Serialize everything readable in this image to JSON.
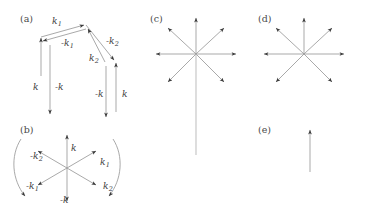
{
  "figure": {
    "width": 371,
    "height": 210,
    "background": "#ffffff",
    "stroke_color": "#9a9a9a",
    "arrowhead_color": "#3a3a3a",
    "label_color": "#3b3b3b",
    "panel_label_color": "#4a4a4a"
  },
  "panels": [
    {
      "id": "a",
      "label": "(a)",
      "label_pos": [
        20,
        13
      ],
      "description": "paired chevron of antiparallel wavevector arrows",
      "labels": [
        {
          "text": "k",
          "sub": "1",
          "x": 52,
          "y": 16,
          "name": "label-k1-outer"
        },
        {
          "text": "-k",
          "sub": "1",
          "x": 61,
          "y": 38,
          "name": "label-minus-k1-inner"
        },
        {
          "text": "k",
          "sub": "2",
          "x": 89,
          "y": 53,
          "name": "label-k2-inner"
        },
        {
          "text": "-k",
          "sub": "2",
          "x": 106,
          "y": 36,
          "name": "label-minus-k2-outer"
        },
        {
          "text": "k",
          "sub": "",
          "x": 33,
          "y": 82,
          "name": "label-k-left-outer"
        },
        {
          "text": "-k",
          "sub": "",
          "x": 55,
          "y": 82,
          "name": "label-minus-k-left-inner"
        },
        {
          "text": "-k",
          "sub": "",
          "x": 95,
          "y": 89,
          "name": "label-minus-k-right-inner"
        },
        {
          "text": "k",
          "sub": "",
          "x": 122,
          "y": 89,
          "name": "label-k-right-outer"
        }
      ]
    },
    {
      "id": "b",
      "label": "(b)",
      "label_pos": [
        20,
        124
      ],
      "description": "six-fold star of wavevectors with two curved rotation arcs",
      "labels": [
        {
          "text": "k",
          "sub": "",
          "x": 71,
          "y": 143,
          "name": "label-k-up"
        },
        {
          "text": "k",
          "sub": "1",
          "x": 100,
          "y": 157,
          "name": "label-k1-upper-right"
        },
        {
          "text": "k",
          "sub": "2",
          "x": 103,
          "y": 181,
          "name": "label-k2-lower-right"
        },
        {
          "text": "-k",
          "sub": "",
          "x": 60,
          "y": 195,
          "name": "label-minus-k-down"
        },
        {
          "text": "-k",
          "sub": "1",
          "x": 26,
          "y": 181,
          "name": "label-minus-k1-lower-left"
        },
        {
          "text": "-k",
          "sub": "2",
          "x": 30,
          "y": 151,
          "name": "label-minus-k2-upper-left"
        }
      ]
    },
    {
      "id": "c",
      "label": "(c)",
      "label_pos": [
        150,
        13
      ],
      "description": "eight-fold star with one extended downward ray",
      "center": [
        196,
        54
      ],
      "ray_length": 40,
      "long_ray_length": 101,
      "ray_count": 8,
      "labels": []
    },
    {
      "id": "d",
      "label": "(d)",
      "label_pos": [
        258,
        13
      ],
      "description": "seven-fold star, downward ray absent",
      "center": [
        304,
        54
      ],
      "ray_length": 40,
      "ray_count": 7,
      "labels": []
    },
    {
      "id": "e",
      "label": "(e)",
      "label_pos": [
        258,
        124
      ],
      "description": "single upward arrow",
      "arrow": {
        "x": 310,
        "y_tail": 172,
        "y_head": 130
      },
      "labels": []
    }
  ]
}
